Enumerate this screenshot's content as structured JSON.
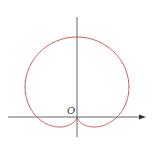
{
  "diagram": {
    "type": "polar-curve",
    "curve": "cardioid",
    "equation": "r = a(1 + sin θ)",
    "origin_label": "O",
    "curve_color": "#d0504a",
    "axis_color": "#555555"
  }
}
